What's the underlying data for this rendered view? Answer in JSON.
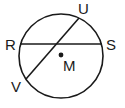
{
  "diagram": {
    "type": "circle-geometry",
    "stroke_color": "#1a1a1a",
    "background": "#ffffff",
    "circle": {
      "center_label": "M"
    },
    "points": {
      "R": "R",
      "S": "S",
      "U": "U",
      "V": "V",
      "M": "M"
    },
    "segments": [
      "RS",
      "UV"
    ]
  }
}
